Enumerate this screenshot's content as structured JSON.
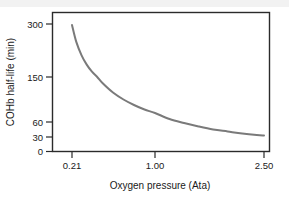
{
  "chart_data": {
    "type": "line",
    "title": "",
    "subtitle": "",
    "xlabel": "Oxygen pressure (Ata)",
    "ylabel": "COHb half-life (min)",
    "xtick_labels": [
      "0.21",
      "1.00",
      "2.50"
    ],
    "xtick_values": [
      0.21,
      1.0,
      2.5
    ],
    "ytick_labels": [
      "0",
      "30",
      "60",
      "150",
      "300"
    ],
    "ytick_values": [
      0,
      30,
      60,
      150,
      300
    ],
    "xlim": [
      0.18,
      2.62
    ],
    "ylim": [
      0,
      330
    ],
    "y_scale": "nonlinear",
    "grid": false,
    "legend": false,
    "legend_position": "none",
    "series": [
      {
        "name": "COHb half-life",
        "color": "#7a7a7a",
        "line_width": 2,
        "x": [
          0.21,
          0.25,
          0.3,
          0.35,
          0.4,
          0.45,
          0.5,
          0.6,
          0.7,
          0.8,
          0.9,
          1.0,
          1.2,
          1.4,
          1.6,
          1.8,
          2.0,
          2.2,
          2.4,
          2.5
        ],
        "y": [
          297,
          250,
          212,
          185,
          165,
          150,
          138,
          119,
          105,
          94,
          85,
          78,
          66,
          58,
          51,
          45,
          41,
          37,
          34,
          33
        ]
      }
    ],
    "annotations": []
  },
  "axis": {
    "x_label": "Oxygen pressure (Ata)",
    "y_label": "COHb half-life (min)"
  }
}
